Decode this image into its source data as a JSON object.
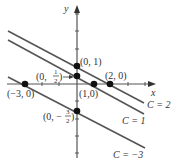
{
  "diagram": {
    "axes": {
      "x_label": "x",
      "y_label": "y"
    },
    "points": [
      {
        "label": "(0, 1)",
        "x": 0,
        "y": 1
      },
      {
        "label_prefix": "(0, ",
        "label_num": "1",
        "label_den": "2",
        "label_suffix": ")",
        "x": 0,
        "y": 0.5
      },
      {
        "label": "(1,0)",
        "x": 1,
        "y": 0
      },
      {
        "label": "(2, 0)",
        "x": 2,
        "y": 0
      },
      {
        "label": "(−3, 0)",
        "x": -3,
        "y": 0
      },
      {
        "label_prefix": "(0, −",
        "label_num": "3",
        "label_den": "2",
        "label_suffix": ")",
        "x": 0,
        "y": -1.5
      }
    ],
    "lines": [
      {
        "label": "C = 2",
        "C": 2
      },
      {
        "label": "C = 1",
        "C": 1
      },
      {
        "label": "C = −3",
        "C": -3
      }
    ],
    "colors": {
      "line": "#555555",
      "axis": "#555555",
      "point": "#111111",
      "text": "#333333"
    }
  }
}
